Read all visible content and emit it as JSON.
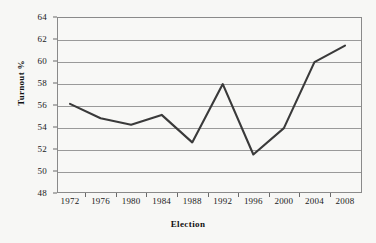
{
  "chart_data": {
    "type": "line",
    "title": "",
    "xlabel": "Election",
    "ylabel": "Turnout %",
    "categories": [
      "1972",
      "1976",
      "1980",
      "1984",
      "1988",
      "1992",
      "1996",
      "2000",
      "2004",
      "2008"
    ],
    "values": [
      56.1,
      54.8,
      54.2,
      55.1,
      52.6,
      57.9,
      51.5,
      53.9,
      59.9,
      61.4
    ],
    "series": [
      {
        "name": "Turnout %",
        "values": [
          56.1,
          54.8,
          54.2,
          55.1,
          52.6,
          57.9,
          51.5,
          53.9,
          59.9,
          61.4
        ]
      }
    ],
    "ylim": [
      48,
      64
    ],
    "ytick_labels": [
      "64",
      "62",
      "60",
      "58",
      "56",
      "54",
      "52",
      "50",
      "48"
    ],
    "ytick_values": [
      64,
      62,
      60,
      58,
      56,
      54,
      52,
      50,
      48
    ],
    "xtick_labels": [
      "1972",
      "1976",
      "1980",
      "1984",
      "1988",
      "1992",
      "1996",
      "2000",
      "2004",
      "2008"
    ],
    "grid": "horizontal",
    "legend": "none",
    "line_color": "#3a3a3a",
    "grid_color": "#9a9a9a",
    "frame_color": "#8a8a8a",
    "background_color": "#f7f7f5",
    "text_color": "#1a1a1a"
  }
}
